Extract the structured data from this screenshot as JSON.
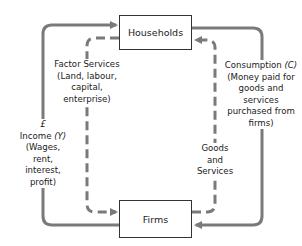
{
  "diagram": {
    "type": "circular-flow-of-income",
    "nodes": {
      "households": "Households",
      "firms": "Firms"
    },
    "flows": {
      "factor_services": {
        "line1": "Factor Services",
        "line2": "(Land, labour,",
        "line3": "capital,",
        "line4": "enterprise)",
        "style": "dashed",
        "direction": "households-to-firms"
      },
      "income": {
        "currency": "£",
        "title": "Income",
        "symbol": "(Y)",
        "line2": "(Wages,",
        "line3": "rent,",
        "line4": "interest,",
        "line5": "profit)",
        "style": "solid",
        "direction": "firms-to-households"
      },
      "consumption": {
        "title": "Consumption",
        "symbol": "(C)",
        "line2": "(Money paid for",
        "line3": "goods and",
        "line4": "services",
        "line5": "purchased from",
        "line6": "firms)",
        "style": "solid",
        "direction": "households-to-firms"
      },
      "goods_services": {
        "line1": "Goods",
        "line2": "and",
        "line3": "Services",
        "style": "dashed",
        "direction": "firms-to-households"
      }
    },
    "colors": {
      "arrow": "#7a7a7a",
      "box_border": "#333333"
    }
  }
}
